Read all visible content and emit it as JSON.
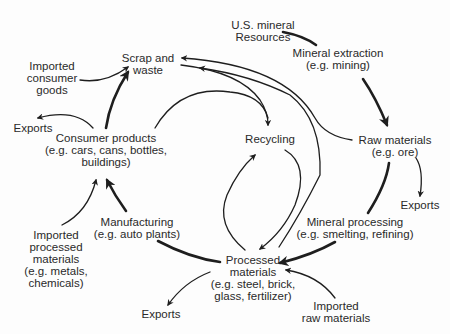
{
  "diagram": {
    "nodes": {
      "us_resources": {
        "lines": [
          "U.S. mineral",
          "Resources"
        ]
      },
      "extraction": {
        "lines": [
          "Mineral extraction",
          "(e.g. mining)"
        ]
      },
      "raw_materials": {
        "lines": [
          "Raw materials",
          "(e.g. ore)"
        ]
      },
      "exports_raw": {
        "lines": [
          "Exports"
        ]
      },
      "processing": {
        "lines": [
          "Mineral processing",
          "(e.g. smelting, refining)"
        ]
      },
      "processed": {
        "lines": [
          "Processed",
          "materials",
          "(e.g. steel, brick,",
          "glass, fertilizer)"
        ]
      },
      "imported_raw": {
        "lines": [
          "Imported",
          "raw materials"
        ]
      },
      "exports_processed": {
        "lines": [
          "Exports"
        ]
      },
      "manufacturing": {
        "lines": [
          "Manufacturing",
          "(e.g. auto plants)"
        ]
      },
      "imported_processed": {
        "lines": [
          "Imported",
          "processed",
          "materials",
          "(e.g. metals,",
          "chemicals)"
        ]
      },
      "consumer": {
        "lines": [
          "Consumer products",
          "(e.g. cars, cans, bottles,",
          "buildings)"
        ]
      },
      "exports_consumer": {
        "lines": [
          "Exports"
        ]
      },
      "imported_consumer": {
        "lines": [
          "Imported",
          "consumer",
          "goods"
        ]
      },
      "scrap": {
        "lines": [
          "Scrap and",
          "waste"
        ]
      },
      "recycling": {
        "lines": [
          "Recycling"
        ]
      }
    },
    "edges": [
      {
        "from": "us_resources",
        "to": "extraction",
        "weight": "heavy"
      },
      {
        "from": "extraction",
        "to": "raw_materials",
        "weight": "heavy"
      },
      {
        "from": "raw_materials",
        "to": "exports_raw",
        "weight": "light"
      },
      {
        "from": "raw_materials",
        "to": "processing",
        "weight": "heavy"
      },
      {
        "from": "raw_materials",
        "to": "scrap",
        "weight": "light"
      },
      {
        "from": "processing",
        "to": "processed",
        "weight": "heavy"
      },
      {
        "from": "processing",
        "to": "scrap",
        "weight": "light"
      },
      {
        "from": "imported_raw",
        "to": "processed",
        "weight": "light"
      },
      {
        "from": "processed",
        "to": "exports_processed",
        "weight": "light"
      },
      {
        "from": "processed",
        "to": "manufacturing",
        "weight": "heavy"
      },
      {
        "from": "processed",
        "to": "recycling",
        "weight": "light"
      },
      {
        "from": "recycling",
        "to": "processed",
        "weight": "light"
      },
      {
        "from": "manufacturing",
        "to": "consumer",
        "weight": "heavy"
      },
      {
        "from": "imported_processed",
        "to": "consumer",
        "weight": "light"
      },
      {
        "from": "consumer",
        "to": "exports_consumer",
        "weight": "light"
      },
      {
        "from": "consumer",
        "to": "scrap",
        "weight": "heavy"
      },
      {
        "from": "consumer",
        "to": "recycling",
        "weight": "light"
      },
      {
        "from": "imported_consumer",
        "to": "scrap",
        "weight": "light"
      },
      {
        "from": "scrap",
        "to": "recycling",
        "weight": "light"
      }
    ],
    "colors": {
      "line": "#1e1e1e",
      "text": "#2a2a2a",
      "background": "#fdfdfd"
    }
  }
}
